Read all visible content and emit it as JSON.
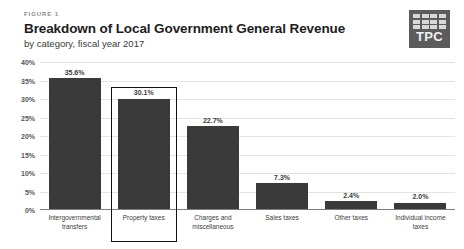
{
  "header": {
    "kicker": "FIGURE 1",
    "title": "Breakdown of Local Government General Revenue",
    "subtitle": "by category, fiscal year 2017"
  },
  "logo": {
    "text": "TPC",
    "icon": "tpc-grid-icon",
    "background_color": "#5c5c5c",
    "tile_color": "#d8d8d8"
  },
  "chart_data": {
    "type": "bar",
    "title": "Breakdown of Local Government General Revenue",
    "subtitle": "by category, fiscal year 2017",
    "xlabel": "",
    "ylabel": "",
    "ylim": [
      0,
      40
    ],
    "ytick_values": [
      0,
      5,
      10,
      15,
      20,
      25,
      30,
      35,
      40
    ],
    "ytick_labels": [
      "0%",
      "5%",
      "10%",
      "15%",
      "20%",
      "25%",
      "30%",
      "35%",
      "40%"
    ],
    "grid": true,
    "legend": "none",
    "bar_color": "#3a3a3a",
    "highlight_color": "#111111",
    "highlighted_category": "Property taxes",
    "categories": [
      "Intergovernmental transfers",
      "Property taxes",
      "Charges and miscellaneous",
      "Sales taxes",
      "Other taxes",
      "Individual income taxes"
    ],
    "values": [
      35.6,
      30.1,
      22.7,
      7.3,
      2.4,
      2.0
    ],
    "value_labels": [
      "35.6%",
      "30.1%",
      "22.7%",
      "7.3%",
      "2.4%",
      "2.0%"
    ]
  }
}
